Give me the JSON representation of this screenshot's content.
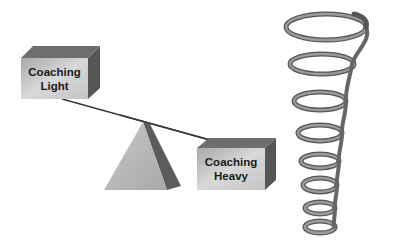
{
  "diagram": {
    "box_light": {
      "line1": "Coaching",
      "line2": "Light"
    },
    "box_heavy": {
      "line1": "Coaching",
      "line2": "Heavy"
    },
    "colors": {
      "box_front": "#c8c8c8",
      "box_top": "#6a6a6a",
      "box_side": "#555555",
      "triangle_front": "#b8b8b8",
      "triangle_side": "#5a5a5a",
      "beam": "#333333",
      "spiral": "#777777"
    }
  }
}
